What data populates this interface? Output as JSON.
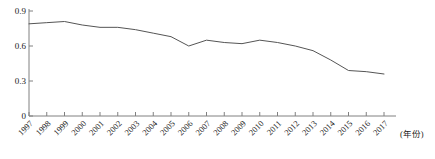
{
  "chart_data": {
    "type": "line",
    "title": "",
    "subtitle": "",
    "xlabel": "(年份)",
    "ylabel": "",
    "xlim": [
      1997,
      2017
    ],
    "ylim": [
      0,
      0.9
    ],
    "grid": false,
    "legend": false,
    "legend_position": "none",
    "line_color": "#555555",
    "axis_color": "#808080",
    "categories": [
      "1997",
      "1998",
      "1999",
      "2000",
      "2001",
      "2002",
      "2003",
      "2004",
      "2005",
      "2006",
      "2007",
      "2008",
      "2009",
      "2010",
      "2011",
      "2012",
      "2013",
      "2014",
      "2015",
      "2016",
      "2017"
    ],
    "x": [
      1997,
      1998,
      1999,
      2000,
      2001,
      2002,
      2003,
      2004,
      2005,
      2006,
      2007,
      2008,
      2009,
      2010,
      2011,
      2012,
      2013,
      2014,
      2015,
      2016,
      2017
    ],
    "values": [
      0.79,
      0.8,
      0.81,
      0.78,
      0.76,
      0.76,
      0.74,
      0.71,
      0.68,
      0.6,
      0.65,
      0.63,
      0.62,
      0.65,
      0.63,
      0.6,
      0.56,
      0.48,
      0.39,
      0.38,
      0.36
    ],
    "ytick_values": [
      0,
      0.3,
      0.6,
      0.9
    ],
    "ytick_labels": [
      "0",
      "0.3",
      "0.6",
      "0.9"
    ],
    "xtick_labels": [
      "1997",
      "1998",
      "1999",
      "2000",
      "2001",
      "2002",
      "2003",
      "2004",
      "2005",
      "2006",
      "2007",
      "2008",
      "2009",
      "2010",
      "2011",
      "2012",
      "2013",
      "2014",
      "2015",
      "2016",
      "2017"
    ],
    "series": [
      {
        "name": "series-1",
        "values": [
          0.79,
          0.8,
          0.81,
          0.78,
          0.76,
          0.76,
          0.74,
          0.71,
          0.68,
          0.6,
          0.65,
          0.63,
          0.62,
          0.65,
          0.63,
          0.6,
          0.56,
          0.48,
          0.39,
          0.38,
          0.36
        ]
      }
    ]
  },
  "axes": {
    "x_axis_name": "year-axis",
    "y_axis_name": "value-axis"
  }
}
